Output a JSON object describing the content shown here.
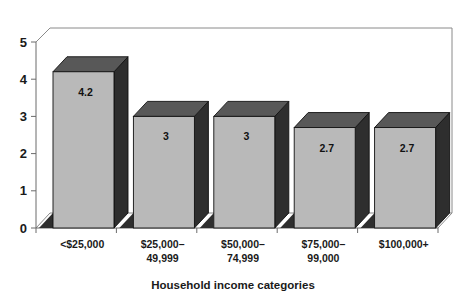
{
  "chart_data": {
    "type": "bar",
    "title": "",
    "subtitle": "",
    "xlabel": "Household income categories",
    "ylabel": "",
    "categories": [
      "<$25,000",
      "$25,000–\n49,999",
      "$50,000–\n74,999",
      "$75,000–\n99,000",
      "$100,000+"
    ],
    "category_lines": [
      [
        "<$25,000"
      ],
      [
        "$25,000–",
        "49,999"
      ],
      [
        "$50,000–",
        "74,999"
      ],
      [
        "$75,000–",
        "99,000"
      ],
      [
        "$100,000+"
      ]
    ],
    "values": [
      4.2,
      3,
      3,
      2.7,
      2.7
    ],
    "value_labels": [
      "4.2",
      "3",
      "3",
      "2.7",
      "2.7"
    ],
    "ylim": [
      0,
      5
    ],
    "yticks": [
      0,
      1,
      2,
      3,
      4,
      5
    ],
    "ytick_labels": [
      "0",
      "1",
      "2",
      "3",
      "4",
      "5"
    ],
    "grid": false,
    "legend": null,
    "legend_position": "none",
    "three_d": true
  },
  "colors": {
    "bar_front": "#b9b9b9",
    "bar_top": "#585858",
    "bar_side": "#2e2e2e",
    "floor_shadow": "#2e2e2e",
    "axis": "#6b6b6b",
    "frame": "#8a8a8a",
    "text": "#1a1a1a",
    "background": "#ffffff"
  },
  "axis_title": {
    "text": "Household income categories"
  }
}
